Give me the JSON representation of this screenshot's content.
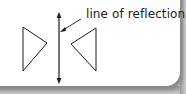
{
  "diagram": {
    "label": "line of reflection",
    "colors": {
      "stroke": "#1a1a1a",
      "background": "#ffffff",
      "shadow": "#8a8a8a"
    },
    "mirror_line": {
      "x": 59,
      "y1": 13,
      "y2": 83,
      "arrowheads": "both"
    },
    "left_triangle": [
      [
        23,
        27
      ],
      [
        47,
        43
      ],
      [
        23,
        71
      ]
    ],
    "right_triangle": [
      [
        96,
        28
      ],
      [
        71,
        44
      ],
      [
        96,
        71
      ]
    ],
    "pointer": {
      "from": [
        80,
        20
      ],
      "to": [
        60,
        32
      ]
    }
  }
}
